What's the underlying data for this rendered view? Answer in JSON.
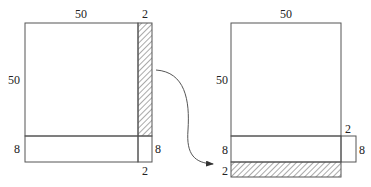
{
  "left_figure": {
    "square_width_label": "50",
    "square_height_label": "50",
    "strip_width_label_top": "2",
    "bottom_strip_height_label_left": "8",
    "bottom_strip_height_label_right": "8",
    "corner_width_label_bottom": "2"
  },
  "right_figure": {
    "square_width_label": "50",
    "square_height_label": "50",
    "corner_width_label": "2",
    "bottom_strip_height_label_left": "8",
    "corner_height_label_right": "8",
    "moved_strip_height_label": "2"
  },
  "colors": {
    "stroke": "#555555",
    "hatch": "#555555",
    "text": "#222222",
    "background": "#ffffff"
  }
}
